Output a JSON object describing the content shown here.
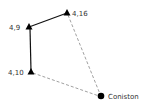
{
  "diagram": {
    "nodes": [
      {
        "id": "n416",
        "label": "4,16",
        "shape": "triangle",
        "x": 67,
        "y": 13,
        "label_x": 72,
        "label_y": 16
      },
      {
        "id": "n49",
        "label": "4,9",
        "shape": "triangle",
        "x": 29,
        "y": 27,
        "label_x": 9,
        "label_y": 30
      },
      {
        "id": "n410",
        "label": "4,10",
        "shape": "triangle",
        "x": 31,
        "y": 72,
        "label_x": 8,
        "label_y": 75
      },
      {
        "id": "coniston",
        "label": "Coniston",
        "shape": "circle",
        "x": 101,
        "y": 96,
        "label_x": 108,
        "label_y": 99
      }
    ],
    "edges": [
      {
        "from": "n49",
        "to": "n416",
        "style": "solid"
      },
      {
        "from": "n49",
        "to": "n410",
        "style": "solid"
      },
      {
        "from": "n416",
        "to": "coniston",
        "style": "dashed"
      },
      {
        "from": "n410",
        "to": "coniston",
        "style": "dashed"
      }
    ],
    "colors": {
      "node": "#000000",
      "solid_edge": "#111111",
      "dashed_edge": "#888888",
      "label": "#333333"
    }
  }
}
